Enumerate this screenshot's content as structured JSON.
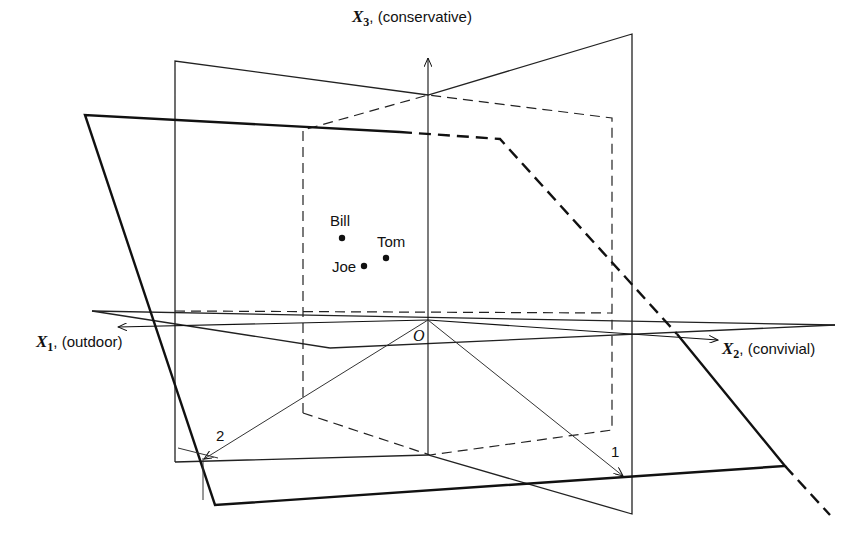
{
  "diagram": {
    "type": "3d-coordinate-planes",
    "axes": [
      {
        "id": "x1",
        "symbol": "X",
        "subscript": "1",
        "label": ", (outdoor)"
      },
      {
        "id": "x2",
        "symbol": "X",
        "subscript": "2",
        "label": ", (convivial)"
      },
      {
        "id": "x3",
        "symbol": "X",
        "subscript": "3",
        "label": ", (conservative)"
      }
    ],
    "origin_label": "O",
    "points": [
      {
        "name": "Bill"
      },
      {
        "name": "Tom"
      },
      {
        "name": "Joe"
      }
    ],
    "vector_labels": {
      "v1": "1",
      "v2": "2"
    },
    "colors": {
      "ink": "#111111",
      "background": "#ffffff"
    }
  }
}
